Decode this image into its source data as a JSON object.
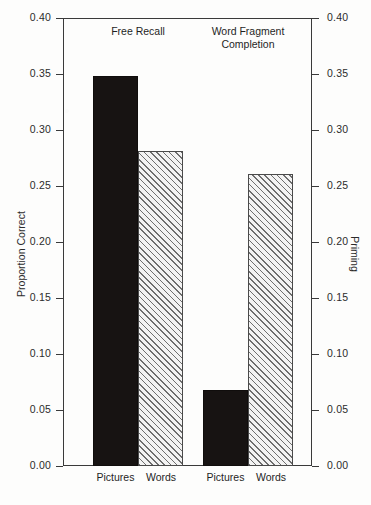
{
  "chart_data": {
    "type": "bar",
    "title": "",
    "subtitle": "",
    "xlabel": "",
    "ylabel": "Proportion Correct",
    "ylabel_right": "Priming",
    "ylim": [
      0.0,
      0.4
    ],
    "ylim_right": [
      0.0,
      0.4
    ],
    "grid": false,
    "legend": "none",
    "yticks": [
      "0.00",
      "0.05",
      "0.10",
      "0.15",
      "0.20",
      "0.25",
      "0.30",
      "0.35",
      "0.40"
    ],
    "ytick_values": [
      0.0,
      0.05,
      0.1,
      0.15,
      0.2,
      0.25,
      0.3,
      0.35,
      0.4
    ],
    "yticks_right": [
      "0.00",
      "0.05",
      "0.10",
      "0.15",
      "0.20",
      "0.25",
      "0.30",
      "0.35",
      "0.40"
    ],
    "group_labels": [
      "Free Recall",
      "Word Fragment\nCompletion"
    ],
    "categories": [
      "Pictures",
      "Words",
      "Pictures",
      "Words"
    ],
    "values": [
      0.348,
      0.281,
      0.068,
      0.261
    ],
    "bars": [
      {
        "group": "Free Recall",
        "category": "Pictures",
        "value": 0.348,
        "fill": "solid"
      },
      {
        "group": "Free Recall",
        "category": "Words",
        "value": 0.281,
        "fill": "hatch"
      },
      {
        "group": "Word Fragment Completion",
        "category": "Pictures",
        "value": 0.068,
        "fill": "solid"
      },
      {
        "group": "Word Fragment Completion",
        "category": "Words",
        "value": 0.261,
        "fill": "hatch"
      }
    ],
    "colors": {
      "solid": "#171312",
      "hatch_line": "#6e6e6e",
      "hatch_bg": "#f3f3f3",
      "axis": "#3a3a3a"
    }
  },
  "axes": {
    "left_title": "Proportion Correct",
    "right_title": "Priming"
  },
  "headers": {
    "group_0": "Free Recall",
    "group_1": "Word Fragment\nCompletion"
  },
  "ticks": {
    "t0": "0.00",
    "t1": "0.05",
    "t2": "0.10",
    "t3": "0.15",
    "t4": "0.20",
    "t5": "0.25",
    "t6": "0.30",
    "t7": "0.35",
    "t8": "0.40"
  },
  "xlabels": {
    "b0": "Pictures",
    "b1": "Words",
    "b2": "Pictures",
    "b3": "Words"
  }
}
